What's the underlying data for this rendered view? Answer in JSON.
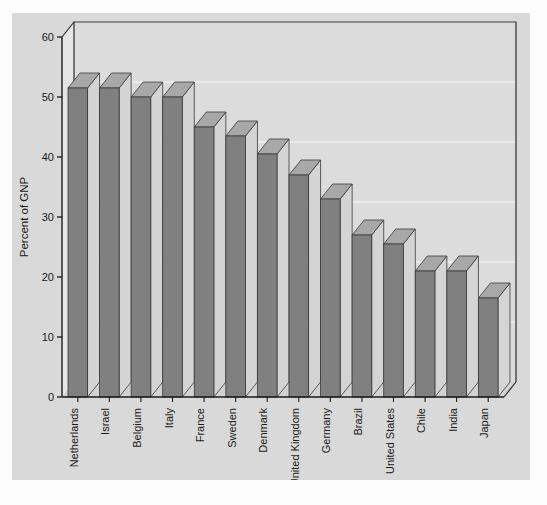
{
  "chart_data": {
    "type": "bar",
    "title": "",
    "xlabel": "",
    "ylabel": "Percent of GNP",
    "ylim": [
      0,
      60
    ],
    "yticks": [
      0,
      10,
      20,
      30,
      40,
      50,
      60
    ],
    "ytick_labels": [
      "0",
      "10",
      "20",
      "30",
      "40",
      "50",
      "60"
    ],
    "grid": true,
    "legend": "none",
    "style": "3d-bar",
    "categories": [
      "Netherlands",
      "Israel",
      "Belgium",
      "Italy",
      "France",
      "Sweden",
      "Denmark",
      "United Kingdom",
      "Germany",
      "Brazil",
      "United States",
      "Chile",
      "India",
      "Japan"
    ],
    "values": [
      51.5,
      51.5,
      50,
      50,
      45,
      43.5,
      40.5,
      37,
      33,
      27,
      25.5,
      21,
      21,
      16.5
    ],
    "colors": {
      "bar_front": "#808080",
      "bar_top": "#a8a8a8",
      "bar_side": "#d4d4d4",
      "panel_background": "#d9d9d9",
      "plot_background": "#dcdcdc",
      "gridline": "#f2f2f2",
      "axis": "#1a1a1a"
    }
  }
}
